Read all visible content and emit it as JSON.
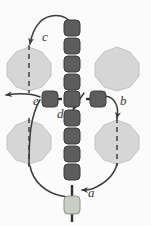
{
  "figure": {
    "type": "diagram",
    "background_color": "#fbfbfb",
    "colors": {
      "cell_dark": "#5d5d5d",
      "cell_dark_edge": "#3c3c3c",
      "cell_highlight": "#c9cdc4",
      "cell_highlight_edge": "#8f948b",
      "blob_fill": "#d6d6d6",
      "blob_edge": "#bdbdbd",
      "link": "#2f2f2f",
      "arrow": "#3a3a3a",
      "dashed_line": "#4a4a4a",
      "label_text": "#3a3a3a"
    },
    "labels": [
      {
        "id": "a",
        "text": "a",
        "x": 88,
        "y": 193,
        "note": "arrowhead on curve entering bottom of vertical chain"
      },
      {
        "id": "b",
        "text": "b",
        "x": 120,
        "y": 101,
        "note": "arrowhead on curve entering right end of horizontal chain"
      },
      {
        "id": "c",
        "text": "c",
        "x": 42,
        "y": 37,
        "note": "arrowhead on curve entering top-left blob"
      },
      {
        "id": "d",
        "text": "d",
        "x": 58,
        "y": 113,
        "note": "arrowhead pointing down at centre junction"
      },
      {
        "id": "e",
        "text": "e",
        "x": 34,
        "y": 101,
        "note": "arrow exiting left past left end of horizontal chain"
      }
    ],
    "vertical_chain": {
      "cell_count": 10,
      "highlighted_index": 9,
      "center_x": 72,
      "cell_size": 14,
      "cells_y": [
        27,
        45,
        63,
        81,
        99,
        117,
        135,
        153,
        171,
        199
      ]
    },
    "horizontal_chain": {
      "cell_count": 3,
      "center_y": 99,
      "cell_size": 14,
      "cells_x": [
        44,
        72,
        100
      ]
    },
    "blobs": [
      {
        "id": "blob-top-left",
        "cx": 29,
        "cy": 69,
        "r": 22,
        "dashed": true
      },
      {
        "id": "blob-top-right",
        "cx": 117,
        "cy": 69,
        "r": 22,
        "dashed": false
      },
      {
        "id": "blob-bottom-left",
        "cx": 29,
        "cy": 142,
        "r": 22,
        "dashed": true
      },
      {
        "id": "blob-bottom-right",
        "cx": 117,
        "cy": 142,
        "r": 22,
        "dashed": true
      }
    ]
  }
}
